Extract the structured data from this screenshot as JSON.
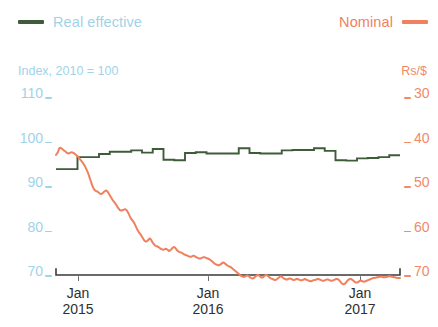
{
  "legend": {
    "left": {
      "label": "Real effective",
      "color": "#3f5c3a",
      "text_color": "#9fd3e8"
    },
    "right": {
      "label": "Nominal",
      "color": "#f0815e",
      "text_color": "#f0815e"
    }
  },
  "axes": {
    "left_title": "Index, 2010 = 100",
    "right_title": "Rs/$",
    "left_color": "#9fd3e8",
    "right_color": "#ef8a6a",
    "x_color": "#2f2f2f"
  },
  "chart_data": {
    "type": "line",
    "title": "",
    "subtitle": "",
    "xlabel": "",
    "ylabel": "Index, 2010 = 100",
    "y2label": "Rs/$",
    "grid": false,
    "legend_position": "top",
    "x_ticks": [
      "Jan 2015",
      "Jan 2016",
      "Jan 2017"
    ],
    "x_tick_months": [
      "Jan",
      "Jan",
      "Jan"
    ],
    "x_tick_years": [
      "2015",
      "2016",
      "2017"
    ],
    "x_range": [
      "2014-10",
      "2017-06"
    ],
    "yticks_left": [
      110,
      100,
      90,
      80,
      70
    ],
    "ylim_left": [
      66,
      114
    ],
    "yticks_right": [
      30,
      40,
      50,
      60,
      70
    ],
    "ylim_right": [
      73.6,
      26.4
    ],
    "y2_inverted": true,
    "series": [
      {
        "name": "Real effective",
        "axis": "left",
        "units": "Index, 2010 = 100",
        "color": "#3f5c3a",
        "style": "step",
        "x": [
          "2014-10",
          "2014-11",
          "2014-12",
          "2015-01",
          "2015-02",
          "2015-03",
          "2015-04",
          "2015-05",
          "2015-06",
          "2015-07",
          "2015-08",
          "2015-09",
          "2015-10",
          "2015-11",
          "2015-12",
          "2016-01",
          "2016-02",
          "2016-03",
          "2016-04",
          "2016-05",
          "2016-06",
          "2016-07",
          "2016-08",
          "2016-09",
          "2016-10",
          "2016-11",
          "2016-12",
          "2017-01",
          "2017-02",
          "2017-03",
          "2017-04",
          "2017-05"
        ],
        "values": [
          92.9,
          92.9,
          95.6,
          95.6,
          96.3,
          96.8,
          96.8,
          97.1,
          96.6,
          97.4,
          95.0,
          94.9,
          96.5,
          96.7,
          96.4,
          96.4,
          96.4,
          97.6,
          96.5,
          96.4,
          96.4,
          97.1,
          97.2,
          97.2,
          97.6,
          97.0,
          94.9,
          94.8,
          95.3,
          95.4,
          95.6,
          96.0
        ]
      },
      {
        "name": "Nominal",
        "axis": "right",
        "units": "Rs/$",
        "color": "#f0815e",
        "style": "line",
        "start": "2014-10",
        "end": "2017-05",
        "values_rs_per_usd": [
          43.9,
          43.6,
          43.2,
          42.5,
          42.3,
          42.4,
          42.6,
          42.8,
          43.0,
          43.1,
          43.4,
          43.5,
          43.6,
          43.5,
          43.4,
          43.3,
          43.4,
          43.5,
          43.7,
          43.9,
          44.1,
          44.3,
          44.6,
          44.9,
          45.2,
          45.5,
          45.8,
          46.2,
          46.6,
          47.1,
          47.6,
          48.2,
          48.9,
          49.6,
          50.3,
          51.0,
          51.5,
          51.8,
          52.0,
          52.1,
          52.2,
          52.4,
          52.6,
          52.7,
          52.6,
          52.4,
          52.2,
          52.0,
          51.9,
          52.1,
          52.4,
          52.8,
          53.2,
          53.6,
          54.0,
          54.3,
          54.6,
          54.9,
          55.3,
          55.7,
          56.0,
          56.3,
          56.4,
          56.4,
          56.3,
          56.2,
          56.1,
          56.2,
          56.5,
          56.9,
          57.4,
          57.9,
          58.3,
          58.6,
          58.9,
          59.3,
          59.8,
          60.3,
          60.8,
          61.2,
          61.5,
          61.8,
          62.2,
          62.6,
          63.0,
          63.3,
          63.4,
          63.3,
          63.1,
          62.8,
          62.7,
          63.0,
          63.4,
          63.8,
          64.1,
          64.3,
          64.4,
          64.5,
          64.6,
          64.8,
          65.0,
          65.1,
          65.2,
          65.2,
          65.1,
          65.0,
          65.1,
          65.3,
          65.5,
          65.4,
          65.2,
          64.9,
          64.7,
          64.6,
          64.8,
          65.1,
          65.4,
          65.6,
          65.7,
          65.8,
          65.9,
          66.0,
          66.2,
          66.3,
          66.4,
          66.5,
          66.6,
          66.7,
          66.8,
          66.8,
          66.7,
          66.6,
          66.6,
          66.7,
          66.9,
          67.0,
          67.1,
          67.2,
          67.2,
          67.1,
          67.0,
          66.9,
          66.9,
          67.0,
          67.1,
          67.2,
          67.3,
          67.4,
          67.6,
          67.8,
          68.0,
          68.2,
          68.4,
          68.5,
          68.6,
          68.7,
          68.7,
          68.6,
          68.4,
          68.2,
          68.1,
          68.2,
          68.4,
          68.6,
          68.8,
          68.9,
          69.0,
          69.1,
          69.3,
          69.5,
          69.7,
          69.9,
          70.1,
          70.3,
          70.5,
          70.7,
          70.9,
          71.1,
          71.2,
          71.3,
          71.3,
          71.2,
          71.1,
          71.0,
          71.1,
          71.3,
          71.5,
          71.6,
          71.7,
          71.6,
          71.4,
          71.2,
          71.0,
          70.9,
          71.0,
          71.2,
          71.4,
          71.5,
          71.4,
          71.2,
          71.0,
          70.9,
          71.0,
          71.2,
          71.4,
          71.6,
          71.7,
          71.8,
          71.9,
          72.0,
          72.0,
          71.9,
          71.7,
          71.5,
          71.3,
          71.2,
          71.3,
          71.5,
          71.7,
          71.8,
          71.9,
          71.9,
          71.8,
          71.7,
          71.7,
          71.8,
          71.9,
          72.0,
          72.0,
          71.9,
          71.8,
          71.8,
          71.9,
          72.0,
          72.1,
          72.1,
          72.0,
          71.9,
          71.8,
          71.9,
          72.0,
          72.1,
          72.2,
          72.3,
          72.3,
          72.2,
          72.1,
          72.0,
          72.0,
          71.9,
          71.8,
          71.8,
          71.9,
          72.0,
          72.1,
          72.2,
          72.2,
          72.1,
          72.0,
          71.9,
          71.9,
          72.0,
          72.1,
          72.2,
          72.2,
          72.1,
          72.0,
          71.9,
          71.8,
          71.8,
          71.9,
          72.1,
          72.4,
          72.7,
          72.9,
          73.0,
          72.9,
          72.7,
          72.4,
          72.1,
          71.9,
          71.8,
          71.8,
          71.9,
          72.1,
          72.3,
          72.5,
          72.6,
          72.6,
          72.5,
          72.3,
          72.2,
          72.2,
          72.3,
          72.4,
          72.4,
          72.3,
          72.2,
          72.1,
          72.0,
          71.9,
          71.8,
          71.7,
          71.6,
          71.6,
          71.5,
          71.5,
          71.4,
          71.4,
          71.3,
          71.3,
          71.3,
          71.3,
          71.4,
          71.4,
          71.4,
          71.3,
          71.3,
          71.2,
          71.2,
          71.2,
          71.3,
          71.3,
          71.4,
          71.4,
          71.5,
          71.5,
          71.6,
          71.6,
          71.6
        ]
      }
    ]
  }
}
